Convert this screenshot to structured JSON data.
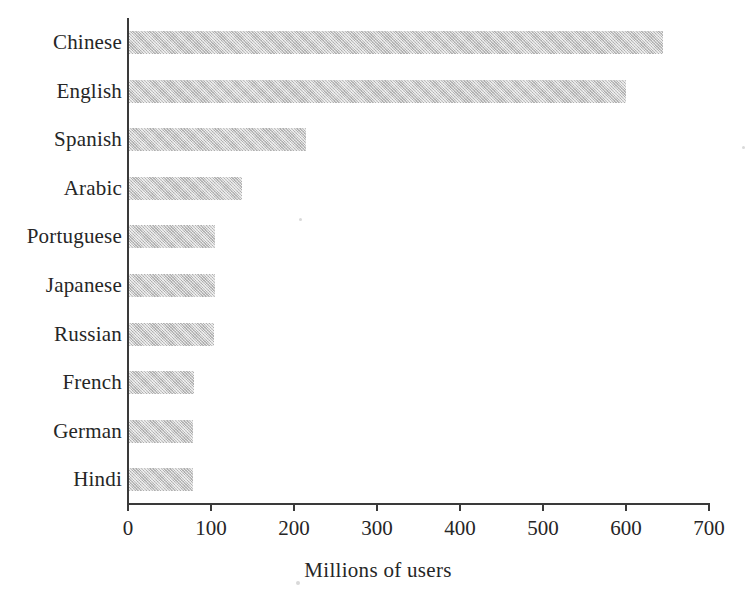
{
  "chart_data": {
    "type": "bar",
    "orientation": "horizontal",
    "title": "",
    "xlabel": "Millions of users",
    "ylabel": "",
    "categories": [
      "Chinese",
      "English",
      "Spanish",
      "Arabic",
      "Portuguese",
      "Japanese",
      "Russian",
      "French",
      "German",
      "Hindi"
    ],
    "values": [
      645,
      600,
      215,
      137,
      105,
      105,
      104,
      80,
      78,
      78
    ],
    "xlim": [
      0,
      700
    ],
    "xticks": [
      0,
      100,
      200,
      300,
      400,
      500,
      600,
      700
    ],
    "xtick_labels": [
      "0",
      "100",
      "200",
      "300",
      "400",
      "500",
      "600",
      "700"
    ],
    "grid": false,
    "legend": false,
    "bar_color": "#c6c6c6",
    "axis_color": "#3a3a3a",
    "background_color": "#ffffff"
  },
  "axis": {
    "x_title": "Millions of users"
  }
}
